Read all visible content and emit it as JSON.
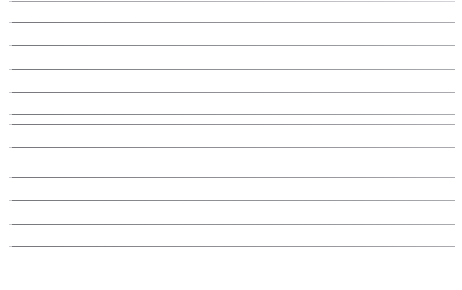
{
  "document": {
    "title": "Ruled Paper",
    "kind": "blank-lined-page",
    "page_width": 462,
    "page_height": 290,
    "background_color": "#ffffff",
    "line_color": "#8d8f93",
    "line_thickness": 1,
    "line_count": 11,
    "line_left": 12,
    "line_right": 455,
    "line_spacing": 22.4,
    "bottom_margin_top": 252,
    "bottom_margin_height": 38,
    "body_text": "",
    "lines": [
      {
        "label": "rule-1",
        "top": 1,
        "left": 12,
        "width": 443,
        "clipped": true
      },
      {
        "label": "rule-2",
        "top": 22,
        "left": 12,
        "width": 443,
        "clipped": false
      },
      {
        "label": "rule-3",
        "top": 45,
        "left": 12,
        "width": 443,
        "clipped": false
      },
      {
        "label": "rule-4",
        "top": 69,
        "left": 12,
        "width": 443,
        "clipped": false
      },
      {
        "label": "rule-5",
        "top": 92,
        "left": 12,
        "width": 443,
        "clipped": false
      },
      {
        "label": "rule-6",
        "top": 114,
        "left": 12,
        "width": 443,
        "clipped": false
      },
      {
        "label": "rule-7",
        "top": 124,
        "left": 12,
        "width": 443,
        "clipped": false
      },
      {
        "label": "rule-8",
        "top": 147,
        "left": 12,
        "width": 443,
        "clipped": false
      },
      {
        "label": "rule-9",
        "top": 177,
        "left": 12,
        "width": 443,
        "clipped": false
      },
      {
        "label": "rule-10",
        "top": 200,
        "left": 12,
        "width": 443,
        "clipped": false
      },
      {
        "label": "rule-11",
        "top": 224,
        "left": 12,
        "width": 443,
        "clipped": false
      },
      {
        "label": "rule-12",
        "top": 246,
        "left": 12,
        "width": 443,
        "clipped": false
      }
    ]
  }
}
